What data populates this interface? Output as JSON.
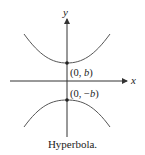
{
  "figure": {
    "caption": "Hyperbola.",
    "axes": {
      "x_label": "x",
      "y_label": "y"
    },
    "points": [
      {
        "label_prefix": "(0, ",
        "label_var": "b",
        "label_suffix": ")",
        "meaning": "upper vertex"
      },
      {
        "label_prefix": "(0, −",
        "label_var": "b",
        "label_suffix": ")",
        "meaning": "lower vertex"
      }
    ],
    "colors": {
      "curve": "#555555",
      "axis": "#333333",
      "text": "#222222"
    }
  }
}
